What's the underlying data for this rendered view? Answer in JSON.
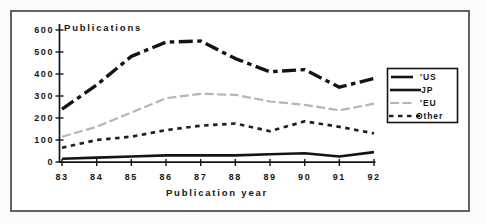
{
  "window": {
    "background_color": "#ffffff",
    "frame_border_color": "#3c3c3c"
  },
  "chart_data": {
    "type": "line",
    "title": "Publications",
    "xlabel": "Publication year",
    "ylabel": "Publications",
    "x_tick_labels": [
      "83",
      "84",
      "85",
      "86",
      "87",
      "88",
      "89",
      "90",
      "91",
      "92"
    ],
    "y_tick_labels": [
      "600",
      "500",
      "400",
      "300",
      "200",
      "100",
      "0"
    ],
    "ylim": [
      0,
      600
    ],
    "y_tick_step": 100,
    "grid": false,
    "legend_position": "right",
    "series": [
      {
        "name": "'US",
        "style": "us",
        "color": "#141414",
        "values": [
          240,
          350,
          480,
          545,
          550,
          470,
          410,
          420,
          340,
          380
        ]
      },
      {
        "name": "JP",
        "style": "jp",
        "color": "#141414",
        "values": [
          15,
          20,
          25,
          30,
          30,
          30,
          35,
          40,
          25,
          45
        ]
      },
      {
        "name": "'EU",
        "style": "eu",
        "color": "#b5b5b5",
        "values": [
          115,
          160,
          225,
          290,
          310,
          305,
          275,
          260,
          235,
          265
        ]
      },
      {
        "name": "Other",
        "style": "other",
        "color": "#202020",
        "values": [
          65,
          100,
          115,
          145,
          165,
          175,
          140,
          185,
          160,
          130
        ]
      }
    ]
  }
}
